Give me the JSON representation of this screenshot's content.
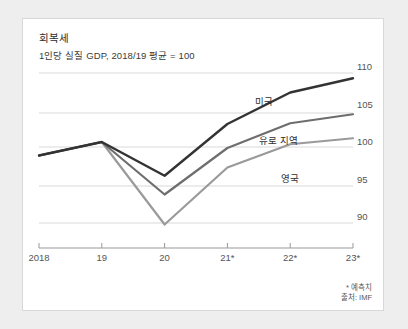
{
  "card": {
    "title": "회복세",
    "subtitle": "1인당 실질 GDP, 2018/19 평균 = 100"
  },
  "footnote": {
    "line1": "* 예측치",
    "line2": "출처: IMF"
  },
  "axes": {
    "y_ticks": [
      "110",
      "105",
      "100",
      "95",
      "90"
    ],
    "x_ticks": [
      "2018",
      "19",
      "20",
      "21*",
      "22*",
      "23*"
    ]
  },
  "series_labels": {
    "us": "미국",
    "euro": "유로 지역",
    "uk": "영국"
  },
  "colors": {
    "us_line": "#333333",
    "euro_line": "#6e6e6e",
    "uk_line": "#9a9a9a",
    "gridline": "#d9d9d9",
    "axis": "#888888",
    "card_bg": "#ffffff",
    "page_bg": "#eeeeee"
  },
  "chart_data": {
    "type": "line",
    "title": "회복세",
    "subtitle": "1인당 실질 GDP, 2018/19 평균 = 100",
    "xlabel": "",
    "ylabel": "",
    "x": [
      "2018",
      "19",
      "20",
      "21*",
      "22*",
      "23*"
    ],
    "ylim": [
      87,
      111
    ],
    "yticks": [
      90,
      95,
      100,
      105,
      110
    ],
    "grid": true,
    "legend": "inline-labels",
    "series": [
      {
        "name": "미국",
        "color": "#333333",
        "values": [
          99.0,
          100.8,
          96.3,
          103.2,
          107.4,
          109.3
        ]
      },
      {
        "name": "유로 지역",
        "color": "#6e6e6e",
        "values": [
          99.0,
          100.8,
          93.8,
          100.0,
          103.3,
          104.5
        ]
      },
      {
        "name": "영국",
        "color": "#9a9a9a",
        "values": [
          99.0,
          100.8,
          89.8,
          97.4,
          100.5,
          101.3
        ]
      }
    ],
    "annotations": [
      "* 예측치",
      "출처: IMF"
    ]
  }
}
